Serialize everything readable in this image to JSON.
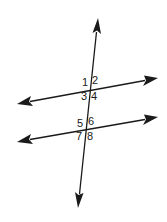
{
  "diagram": {
    "type": "parallel-lines-cut-by-transversal",
    "colors": {
      "stroke": "#1a1a1a",
      "background": "#ffffff"
    },
    "lines": [
      {
        "name": "transversal",
        "from": [
          78,
          208
        ],
        "to": [
          98,
          18
        ]
      },
      {
        "name": "upper-parallel-line",
        "from": [
          17,
          104
        ],
        "to": [
          158,
          78
        ]
      },
      {
        "name": "lower-parallel-line",
        "from": [
          17,
          142
        ],
        "to": [
          158,
          117
        ]
      }
    ],
    "intersections": [
      {
        "name": "upper-intersection",
        "point": [
          90,
          89
        ]
      },
      {
        "name": "lower-intersection",
        "point": [
          86,
          128
        ]
      }
    ],
    "angle_labels": [
      {
        "id": "1",
        "text": "1",
        "x": 82,
        "y": 77
      },
      {
        "id": "2",
        "text": "2",
        "x": 92,
        "y": 75
      },
      {
        "id": "3",
        "text": "3",
        "x": 81,
        "y": 91
      },
      {
        "id": "4",
        "text": "4",
        "x": 91,
        "y": 91
      },
      {
        "id": "5",
        "text": "5",
        "x": 77,
        "y": 118
      },
      {
        "id": "6",
        "text": "6",
        "x": 88,
        "y": 116
      },
      {
        "id": "7",
        "text": "7",
        "x": 76,
        "y": 131
      },
      {
        "id": "8",
        "text": "8",
        "x": 87,
        "y": 131
      }
    ]
  }
}
